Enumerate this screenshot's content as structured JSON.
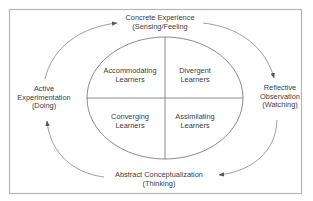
{
  "diagram": {
    "type": "learning-cycle",
    "frame_color": "#b5b5b5",
    "line_color": "#6e6e6e",
    "text_color": "#3c3c3c",
    "outer_stages": {
      "top": {
        "line1": "Concrete Experience",
        "line2": "(Sensing/Feeling"
      },
      "right": {
        "line1": "Reflective",
        "line2": "Observation",
        "line3": "(Watching)"
      },
      "bottom": {
        "line1": "Abstract Conceptualization",
        "line2": "(Thinking)"
      },
      "left": {
        "line1": "Active",
        "line2": "Experimentation",
        "line3": "(Doing)"
      }
    },
    "quadrants": {
      "top_left": {
        "line1": "Accommodating",
        "line2": "Learners"
      },
      "top_right": {
        "line1": "Divergent",
        "line2": "Learners"
      },
      "bottom_left": {
        "line1": "Converging",
        "line2": "Learners"
      },
      "bottom_right": {
        "line1": "Assimilating",
        "line2": "Learners"
      }
    },
    "arrows": [
      {
        "from": "left",
        "to": "top",
        "direction": "clockwise"
      },
      {
        "from": "top",
        "to": "right",
        "direction": "clockwise"
      },
      {
        "from": "right",
        "to": "bottom",
        "direction": "clockwise"
      },
      {
        "from": "bottom",
        "to": "left",
        "direction": "clockwise"
      }
    ]
  }
}
